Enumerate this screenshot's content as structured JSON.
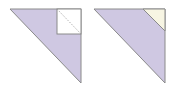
{
  "figures": [
    {
      "name": "triangle-with-square-cutout",
      "triangle": {
        "points": "10,9 81,9 81,83",
        "fill": "#cfc8e2",
        "stroke": "#8a8a8a"
      },
      "square": {
        "x": 57,
        "y": 9,
        "w": 24,
        "h": 25,
        "fill": "#ffffff",
        "stroke": "#8a8a8a"
      },
      "dashed_diagonal": {
        "x1": 57,
        "y1": 9,
        "x2": 81,
        "y2": 34,
        "stroke": "#999999"
      }
    },
    {
      "name": "triangle-with-corner-triangle",
      "triangle": {
        "points": "94,9 165,9 165,83",
        "fill": "#cfc8e2",
        "stroke": "#8a8a8a"
      },
      "corner_triangle": {
        "points": "143,9 165,9 165,31",
        "fill": "#f7f5e3",
        "stroke": "#8a8a8a"
      }
    }
  ],
  "colors": {
    "lavender": "#cfc8e2",
    "cream": "#f7f5e3",
    "outline": "#8a8a8a",
    "background": "#ffffff"
  }
}
